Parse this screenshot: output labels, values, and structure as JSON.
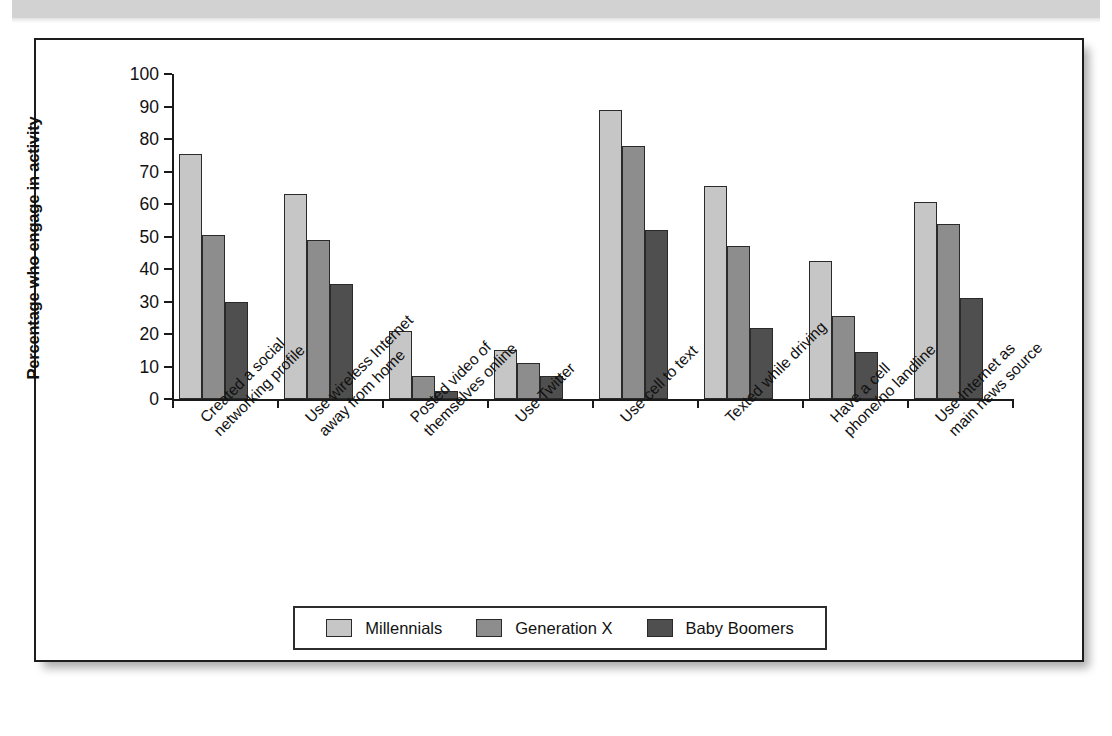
{
  "page": {
    "background_band_color": "#d2d2d2",
    "frame_border_color": "#1d1d1d"
  },
  "chart_data": {
    "type": "bar",
    "title": "",
    "xlabel": "",
    "ylabel": "Percentage who engage in activity",
    "ylim": [
      0,
      100
    ],
    "ytick_labels": [
      "0",
      "10",
      "20",
      "30",
      "40",
      "50",
      "60",
      "70",
      "80",
      "90",
      "100"
    ],
    "yticks": [
      0,
      10,
      20,
      30,
      40,
      50,
      60,
      70,
      80,
      90,
      100
    ],
    "grid": false,
    "legend_position": "bottom",
    "categories": [
      "Created a social\nnetworking profile",
      "Use wireless Internet\naway from home",
      "Posted video of\nthemselves online",
      "Use Twitter",
      "Use cell to text",
      "Texted while driving",
      "Have a cell\nphone/no landline",
      "Use Internet as\nmain news source"
    ],
    "category_lines": [
      [
        "Created a social",
        "networking profile"
      ],
      [
        "Use wireless Internet",
        "away from home"
      ],
      [
        "Posted video of",
        "themselves online"
      ],
      [
        "Use Twitter"
      ],
      [
        "Use cell to text"
      ],
      [
        "Texted while driving"
      ],
      [
        "Have a cell",
        "phone/no landline"
      ],
      [
        "Use Internet as",
        "main news source"
      ]
    ],
    "series": [
      {
        "name": "Millennials",
        "color": "#c6c6c6",
        "values": [
          75.5,
          63,
          21,
          15,
          89,
          65.5,
          42.5,
          60.5
        ]
      },
      {
        "name": "Generation X",
        "color": "#8d8d8d",
        "values": [
          50.5,
          49,
          7,
          11,
          78,
          47,
          25.5,
          54
        ]
      },
      {
        "name": "Baby Boomers",
        "color": "#4f4f4f",
        "values": [
          30,
          35.5,
          2.5,
          7,
          52,
          22,
          14.5,
          31
        ]
      }
    ]
  }
}
